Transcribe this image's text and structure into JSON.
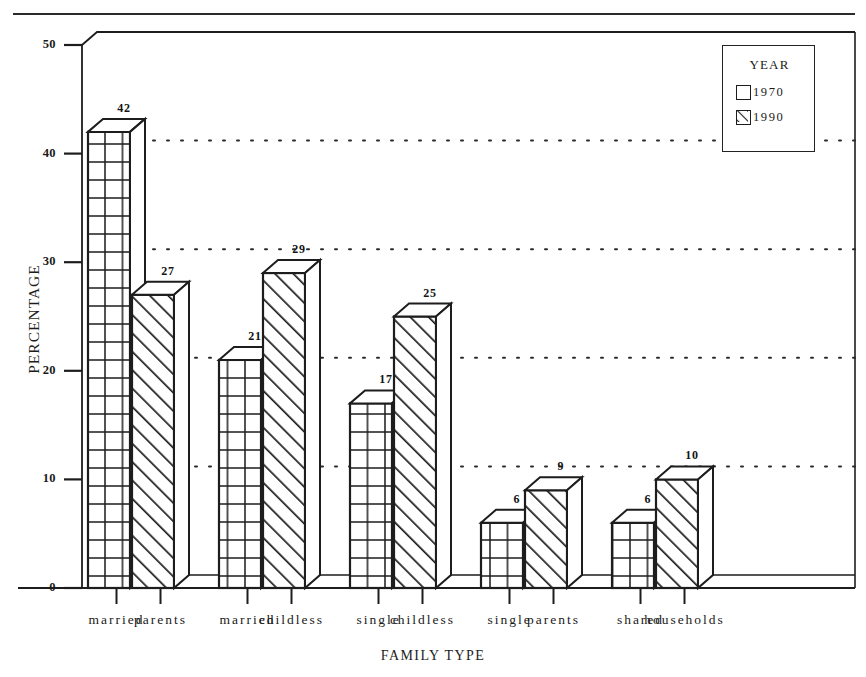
{
  "chart_data": {
    "type": "bar",
    "title": "",
    "xlabel": "FAMILY TYPE",
    "ylabel": "PERCENTAGE",
    "categories": [
      "married parents",
      "married childless",
      "single childless",
      "single parents",
      "shared households"
    ],
    "category_words": [
      [
        "married",
        "parents"
      ],
      [
        "married",
        "childless"
      ],
      [
        "single",
        "childless"
      ],
      [
        "single",
        "parents"
      ],
      [
        "shared",
        "households"
      ]
    ],
    "series": [
      {
        "name": "1970",
        "values": [
          42,
          21,
          17,
          6,
          6
        ],
        "pattern": "grid"
      },
      {
        "name": "1990",
        "values": [
          27,
          29,
          25,
          9,
          10
        ],
        "pattern": "diagonal-hatch"
      }
    ],
    "ylim": [
      0,
      50
    ],
    "yticks": [
      0,
      10,
      20,
      30,
      40,
      50
    ],
    "ytick_labels": [
      "0",
      "10",
      "20",
      "30",
      "40",
      "50"
    ],
    "grid": true,
    "grid_style": "dotted",
    "grid_values": [
      10,
      20,
      30,
      40
    ],
    "legend": {
      "title": "YEAR",
      "position": "top-right",
      "entries": [
        "1970",
        "1990"
      ]
    },
    "style": "3d-bars",
    "data_labels": [
      42,
      27,
      21,
      29,
      17,
      25,
      6,
      9,
      6,
      10
    ],
    "colors": {
      "line": "#1d1d1d",
      "fill": "#ffffff",
      "background": "#ffffff"
    }
  }
}
